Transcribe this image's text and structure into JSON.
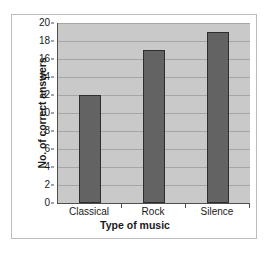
{
  "chart_data": {
    "type": "bar",
    "title": "",
    "xlabel": "Type of music",
    "ylabel": "No. of correct answers",
    "categories": [
      "Classical",
      "Rock",
      "Silence"
    ],
    "values": [
      12,
      17,
      19
    ],
    "series": [
      {
        "name": "No. of correct answers",
        "values": [
          12,
          17,
          19
        ]
      }
    ],
    "ylim": [
      0,
      20
    ],
    "ytick_step": 2,
    "ytick_labels": [
      "0",
      "2",
      "4",
      "6",
      "8",
      "10",
      "12",
      "14",
      "16",
      "18",
      "20"
    ],
    "grid": "horizontal",
    "legend": "none",
    "orientation": "vertical",
    "colors": {
      "bar_fill": "#636363",
      "bar_outline": "#2e2e2e",
      "plot_background": "#c9c9c9",
      "gridline": "#a6a6a6",
      "axis_line": "#4f4f4f",
      "text": "#1a1a1a",
      "frame_border": "#bcbcbc",
      "page_background": "#ffffff"
    }
  }
}
